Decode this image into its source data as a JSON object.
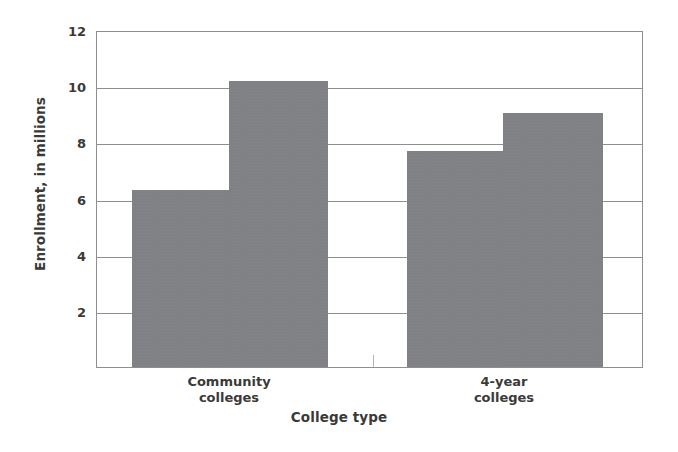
{
  "chart_data": {
    "type": "bar",
    "title": "",
    "subtitle": "",
    "xlabel": "College type",
    "ylabel": "Enrollment, in millions",
    "categories": [
      "Community colleges",
      "4-year colleges"
    ],
    "category_labels_multiline": [
      "Community\ncolleges",
      "4-year\ncolleges"
    ],
    "series": [
      {
        "name": "series-1",
        "values": [
          6.3,
          7.7
        ]
      },
      {
        "name": "series-2",
        "values": [
          10.2,
          9.05
        ]
      }
    ],
    "bars": [
      {
        "group": "Community colleges",
        "series": "series-1",
        "value": 6.3
      },
      {
        "group": "Community colleges",
        "series": "series-2",
        "value": 10.2
      },
      {
        "group": "4-year colleges",
        "series": "series-1",
        "value": 7.7
      },
      {
        "group": "4-year colleges",
        "series": "series-2",
        "value": 9.05
      }
    ],
    "ylim": [
      0,
      12
    ],
    "yticks": [
      2,
      4,
      6,
      8,
      10,
      12
    ],
    "ytick_labels": [
      "2",
      "4",
      "6",
      "8",
      "10",
      "12"
    ],
    "grid": true,
    "grid_axis": "y",
    "legend": false,
    "legend_position": "none",
    "bar_color": "#808184",
    "axis_color": "#8e8e8e",
    "text_color": "#3a3a38",
    "background": "#ffffff"
  }
}
